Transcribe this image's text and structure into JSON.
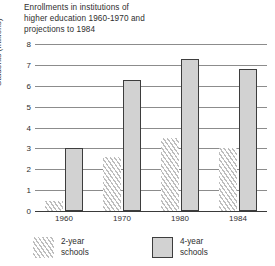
{
  "chart_data": {
    "type": "bar",
    "title": "Enrollments in institutions of higher education 1960-1970 and projections to 1984",
    "title_lines": [
      "Enrollments in institutions of",
      "higher education 1960-1970 and",
      "projections to 1984"
    ],
    "xlabel": "",
    "ylabel": "Students (millions)",
    "ylim": [
      0,
      8
    ],
    "ytick_labels": [
      "0",
      "1",
      "2",
      "3",
      "4",
      "5",
      "6",
      "7",
      "8"
    ],
    "ytick_values": [
      0,
      1,
      2,
      3,
      4,
      5,
      6,
      7,
      8
    ],
    "grid": true,
    "legend_position": "bottom",
    "categories": [
      "1960",
      "1970",
      "1980",
      "1984"
    ],
    "series": [
      {
        "name": "2-year schools",
        "name_lines": [
          "2-year",
          "schools"
        ],
        "pattern": "diagonal-hatch",
        "color": "#bdbdbd",
        "values": [
          0.5,
          2.6,
          3.5,
          3.0
        ]
      },
      {
        "name": "4-year schools",
        "name_lines": [
          "4-year",
          "schools"
        ],
        "pattern": "solid",
        "color": "#d2d2d2",
        "border_color": "#3d3d3d",
        "values": [
          3.0,
          6.3,
          7.3,
          6.8
        ]
      }
    ]
  }
}
